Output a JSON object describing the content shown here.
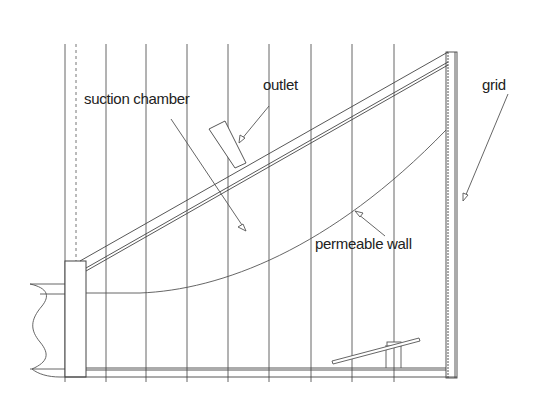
{
  "diagram": {
    "type": "schematic",
    "labels": {
      "suction_chamber": "suction chamber",
      "outlet": "outlet",
      "grid": "grid",
      "permeable_wall": "permeable wall"
    },
    "colors": {
      "line": "#444444",
      "text": "#222222",
      "background": "#ffffff"
    },
    "grid_lines_x": [
      65,
      106,
      146,
      187,
      228,
      269,
      311,
      352,
      394,
      435
    ],
    "dashed_line_x": 76
  }
}
